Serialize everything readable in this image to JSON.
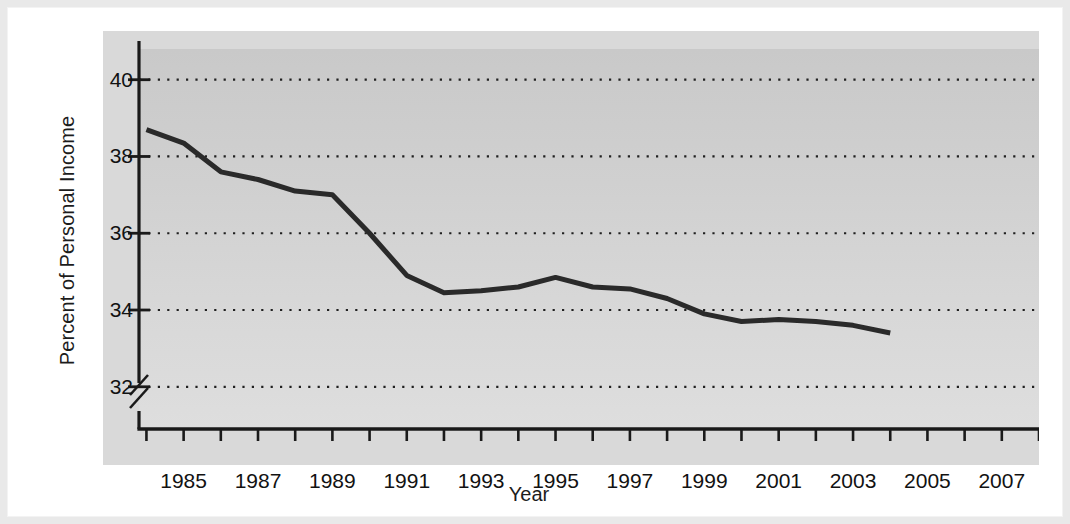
{
  "chart_data": {
    "type": "line",
    "title": "",
    "xlabel": "Year",
    "ylabel": "Percent of Personal Income",
    "xlim": [
      1983.8,
      2008.0
    ],
    "ylim": [
      30.9,
      40.8
    ],
    "grid": true,
    "gridstyle": "dotted-horizontal",
    "legend": "none",
    "y_axis_break": true,
    "x_tick_interval": 1,
    "x_labeled_interval": 2,
    "x_tick_values": [
      1984,
      1985,
      1986,
      1987,
      1988,
      1989,
      1990,
      1991,
      1992,
      1993,
      1994,
      1995,
      1996,
      1997,
      1998,
      1999,
      2000,
      2001,
      2002,
      2003,
      2004,
      2005,
      2006,
      2007,
      2008
    ],
    "x_tick_labels": [
      "1985",
      "1987",
      "1989",
      "1991",
      "1993",
      "1995",
      "1997",
      "1999",
      "2001",
      "2003",
      "2005",
      "2007"
    ],
    "x_labeled_values": [
      1985,
      1987,
      1989,
      1991,
      1993,
      1995,
      1997,
      1999,
      2001,
      2003,
      2005,
      2007
    ],
    "y_tick_labels": [
      "32",
      "34",
      "36",
      "38",
      "40"
    ],
    "y_tick_values": [
      32,
      34,
      36,
      38,
      40
    ],
    "line_color": "#2a2a2a",
    "line_width": 5,
    "plot_bg_top": "#c9c9c9",
    "plot_bg_bottom": "#dedede",
    "band_bg": "#d9d9d9",
    "axis_color": "#1a1a1a",
    "series": [
      {
        "name": "Percent of Personal Income",
        "x": [
          1984,
          1985,
          1986,
          1987,
          1988,
          1989,
          1990,
          1991,
          1992,
          1993,
          1994,
          1995,
          1996,
          1997,
          1998,
          1999,
          2000,
          2001,
          2002,
          2003,
          2004
        ],
        "values": [
          38.7,
          38.35,
          37.6,
          37.4,
          37.1,
          37.0,
          36.0,
          34.9,
          34.45,
          34.5,
          34.6,
          34.85,
          34.6,
          34.55,
          34.3,
          33.9,
          33.7,
          33.75,
          33.7,
          33.6,
          33.4
        ]
      }
    ]
  },
  "figure": {
    "y_axis_title": "Percent of Personal Income",
    "x_axis_title": "Year"
  }
}
